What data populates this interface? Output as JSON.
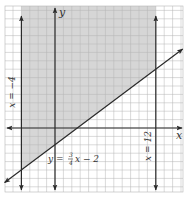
{
  "chart_data": {
    "type": "line",
    "title": "",
    "xlabel": "x",
    "ylabel": "y",
    "grid": true,
    "xlim": [
      -6,
      15
    ],
    "ylim": [
      -7,
      15
    ],
    "unit_px": 8.4,
    "origin_px": [
      55,
      128
    ],
    "lines": [
      {
        "name": "x = -4",
        "label": "x = -4",
        "type": "vertical",
        "x": -4
      },
      {
        "name": "x = 12",
        "label": "x = 12",
        "type": "vertical",
        "x": 12
      },
      {
        "name": "y = 3/4 x - 2",
        "label_prefix": "y = ",
        "label_num": "3",
        "label_den": "4",
        "label_suffix": "x − 2",
        "type": "linear",
        "slope": 0.75,
        "intercept": -2
      }
    ],
    "shaded_region": {
      "description": "y >= (3/4)x - 2, x >= -4, x <= 12",
      "color": "#d9d9d9"
    },
    "axes": {
      "x_label": "x",
      "y_label": "y"
    }
  },
  "labels": {
    "x_axis": "x",
    "y_axis": "y",
    "left_line": "x = −4",
    "right_line": "x = 12",
    "eq_prefix": "y = ",
    "eq_num": "3",
    "eq_den": "4",
    "eq_suffix": "x − 2"
  },
  "colors": {
    "grid": "#b5b5b5",
    "shade": "#d6d6d6",
    "line": "#2a2a2a",
    "background": "#ffffff"
  }
}
